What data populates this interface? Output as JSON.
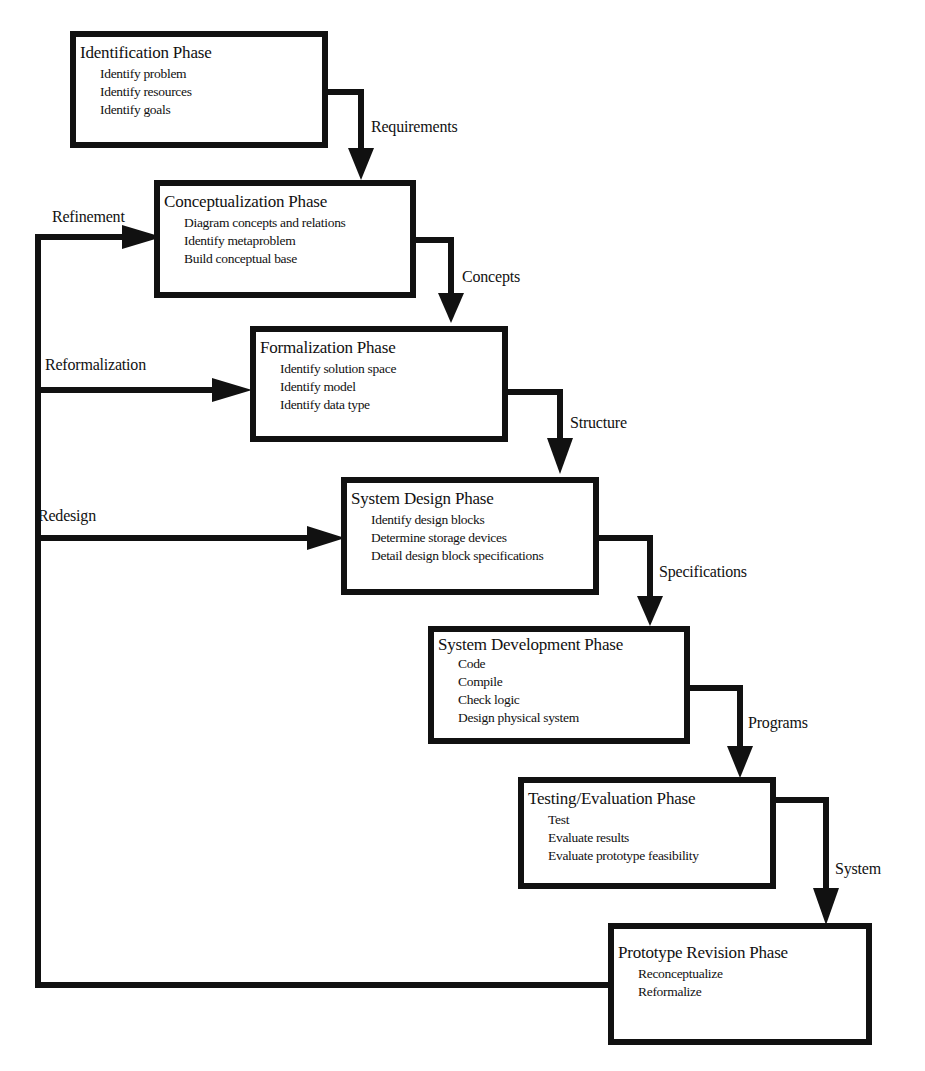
{
  "diagram": {
    "type": "waterfall-flowchart",
    "phases": [
      {
        "id": "identification",
        "title": "Identification Phase",
        "items": [
          "Identify problem",
          "Identify resources",
          "Identify goals"
        ]
      },
      {
        "id": "conceptualization",
        "title": "Conceptualization Phase",
        "items": [
          "Diagram concepts and relations",
          "Identify metaproblem",
          "Build conceptual base"
        ]
      },
      {
        "id": "formalization",
        "title": "Formalization Phase",
        "items": [
          "Identify solution space",
          "Identify model",
          "Identify data type"
        ]
      },
      {
        "id": "system-design",
        "title": "System Design Phase",
        "items": [
          "Identify design blocks",
          "Determine storage devices",
          "Detail design block specifications"
        ]
      },
      {
        "id": "system-development",
        "title": "System Development Phase",
        "items": [
          "Code",
          "Compile",
          "Check logic",
          "Design physical system"
        ]
      },
      {
        "id": "testing-evaluation",
        "title": "Testing/Evaluation Phase",
        "items": [
          "Test",
          "Evaluate results",
          "Evaluate prototype feasibility"
        ]
      },
      {
        "id": "prototype-revision",
        "title": "Prototype Revision Phase",
        "items": [
          "Reconceptualize",
          "Reformalize"
        ]
      }
    ],
    "forward_edges": [
      {
        "from": "identification",
        "to": "conceptualization",
        "label": "Requirements"
      },
      {
        "from": "conceptualization",
        "to": "formalization",
        "label": "Concepts"
      },
      {
        "from": "formalization",
        "to": "system-design",
        "label": "Structure"
      },
      {
        "from": "system-design",
        "to": "system-development",
        "label": "Specifications"
      },
      {
        "from": "system-development",
        "to": "testing-evaluation",
        "label": "Programs"
      },
      {
        "from": "testing-evaluation",
        "to": "prototype-revision",
        "label": "System"
      }
    ],
    "feedback_edges": [
      {
        "from": "prototype-revision",
        "to": "conceptualization",
        "label": "Refinement"
      },
      {
        "from": "prototype-revision",
        "to": "formalization",
        "label": "Reformalization"
      },
      {
        "from": "prototype-revision",
        "to": "system-design",
        "label": "Redesign"
      }
    ]
  }
}
